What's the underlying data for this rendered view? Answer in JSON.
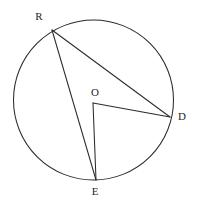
{
  "diagram": {
    "kind": "circle-geometry",
    "canvas": {
      "width": 199,
      "height": 205,
      "background": "#ffffff"
    },
    "stroke_color": "#2b2b2b",
    "label_color": "#1f1f1f",
    "circle": {
      "name": "main-circle",
      "cx": 93.5,
      "cy": 100,
      "r": 80
    },
    "points": [
      {
        "id": "R",
        "label": "R",
        "x": 52,
        "y": 30,
        "on_circle": true,
        "label_x": 39,
        "label_y": 17
      },
      {
        "id": "O",
        "label": "O",
        "x": 93,
        "y": 103,
        "on_circle": false,
        "label_x": 95,
        "label_y": 93
      },
      {
        "id": "D",
        "label": "D",
        "x": 170,
        "y": 117,
        "on_circle": true,
        "label_x": 182,
        "label_y": 117
      },
      {
        "id": "E",
        "label": "E",
        "x": 96,
        "y": 180,
        "on_circle": true,
        "label_x": 95,
        "label_y": 192
      }
    ],
    "segments": [
      {
        "id": "RD",
        "from": "R",
        "to": "D",
        "type": "chord",
        "x1": 52,
        "y1": 30,
        "x2": 170,
        "y2": 117
      },
      {
        "id": "RE",
        "from": "R",
        "to": "E",
        "type": "chord",
        "x1": 52,
        "y1": 30,
        "x2": 96,
        "y2": 180
      },
      {
        "id": "OD",
        "from": "O",
        "to": "D",
        "type": "radius",
        "x1": 93,
        "y1": 103,
        "x2": 170,
        "y2": 117
      },
      {
        "id": "OE",
        "from": "O",
        "to": "E",
        "type": "radius",
        "x1": 93,
        "y1": 103,
        "x2": 96,
        "y2": 180
      }
    ],
    "labels": {
      "R": "R",
      "O": "O",
      "D": "D",
      "E": "E"
    }
  }
}
